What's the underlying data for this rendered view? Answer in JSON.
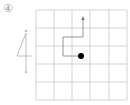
{
  "problem": {
    "number_label": "④",
    "digit_shown": "4",
    "digit_stroke_start_mark": "s",
    "digit_stroke_end_mark": "s"
  },
  "grid": {
    "rows": 5,
    "cols": 5,
    "line_color": "#c8c8c8"
  },
  "path": {
    "color": "#9a9a9a",
    "start_dot_color": "#000000",
    "description": "from dot go left, up, right, up to arrow"
  }
}
